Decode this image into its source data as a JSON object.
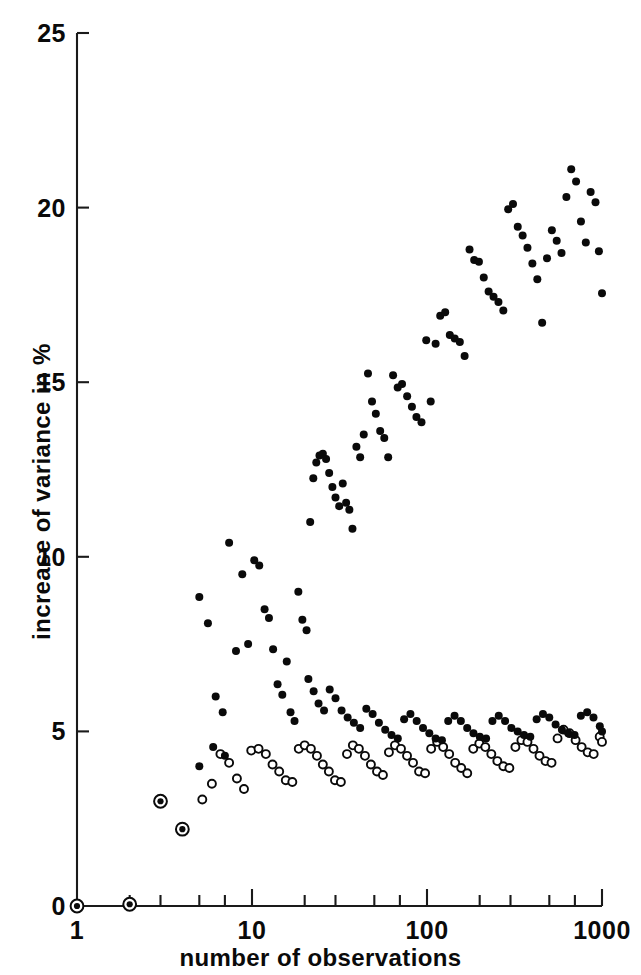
{
  "chart_data": {
    "type": "scatter",
    "title": "",
    "xlabel": "number of observations",
    "ylabel": "increase of variance in %",
    "xscale": "log",
    "xlim": [
      1,
      1000
    ],
    "ylim": [
      0,
      25
    ],
    "grid": false,
    "legend_position": "none",
    "xticks": [
      {
        "value": 1,
        "label": "1"
      },
      {
        "value": 2,
        "label": ""
      },
      {
        "value": 3,
        "label": ""
      },
      {
        "value": 5,
        "label": ""
      },
      {
        "value": 7,
        "label": ""
      },
      {
        "value": 10,
        "label": "10"
      },
      {
        "value": 20,
        "label": ""
      },
      {
        "value": 30,
        "label": ""
      },
      {
        "value": 50,
        "label": ""
      },
      {
        "value": 70,
        "label": ""
      },
      {
        "value": 100,
        "label": "100"
      },
      {
        "value": 200,
        "label": ""
      },
      {
        "value": 300,
        "label": ""
      },
      {
        "value": 500,
        "label": ""
      },
      {
        "value": 700,
        "label": ""
      },
      {
        "value": 1000,
        "label": "1000"
      }
    ],
    "xtick_major_labels": [
      "1",
      "10",
      "100",
      "1000"
    ],
    "yticks": [
      {
        "value": 0,
        "label": "0"
      },
      {
        "value": 5,
        "label": "5"
      },
      {
        "value": 10,
        "label": "10"
      },
      {
        "value": 15,
        "label": "15"
      },
      {
        "value": 20,
        "label": "20"
      },
      {
        "value": 25,
        "label": "25"
      }
    ],
    "series": [
      {
        "name": "filled-series",
        "marker": "filled-circle",
        "color": "#0a0a0a",
        "points": [
          [
            1,
            0.0
          ],
          [
            2,
            0.05
          ],
          [
            3,
            3.0
          ],
          [
            4,
            2.2
          ],
          [
            5,
            8.85
          ],
          [
            5.6,
            8.1
          ],
          [
            6.2,
            6.0
          ],
          [
            6.8,
            5.55
          ],
          [
            7.4,
            10.4
          ],
          [
            8.1,
            7.3
          ],
          [
            8.8,
            9.5
          ],
          [
            9.5,
            7.5
          ],
          [
            10.3,
            9.9
          ],
          [
            11.0,
            9.75
          ],
          [
            11.8,
            8.5
          ],
          [
            12.5,
            8.25
          ],
          [
            13.2,
            7.35
          ],
          [
            14.0,
            6.35
          ],
          [
            14.9,
            6.05
          ],
          [
            15.8,
            7.0
          ],
          [
            16.6,
            5.55
          ],
          [
            17.5,
            5.3
          ],
          [
            18.4,
            9.0
          ],
          [
            19.4,
            8.2
          ],
          [
            20.5,
            7.9
          ],
          [
            21.5,
            11.0
          ],
          [
            22.4,
            12.25
          ],
          [
            23.3,
            12.7
          ],
          [
            24.3,
            12.9
          ],
          [
            25.4,
            12.95
          ],
          [
            26.5,
            12.8
          ],
          [
            27.6,
            12.4
          ],
          [
            28.8,
            12.0
          ],
          [
            30.0,
            11.7
          ],
          [
            31.5,
            11.45
          ],
          [
            33.0,
            12.1
          ],
          [
            34.5,
            11.55
          ],
          [
            36.0,
            11.35
          ],
          [
            37.5,
            10.8
          ],
          [
            39.5,
            13.15
          ],
          [
            41.5,
            12.85
          ],
          [
            43.5,
            13.5
          ],
          [
            46.0,
            15.25
          ],
          [
            48.5,
            14.45
          ],
          [
            51.0,
            14.1
          ],
          [
            54.0,
            13.6
          ],
          [
            57.0,
            13.4
          ],
          [
            60.0,
            12.85
          ],
          [
            64.0,
            15.2
          ],
          [
            68.0,
            14.85
          ],
          [
            72.0,
            14.95
          ],
          [
            77.0,
            14.6
          ],
          [
            82.0,
            14.3
          ],
          [
            87.0,
            14.0
          ],
          [
            93.0,
            13.85
          ],
          [
            99.0,
            16.2
          ],
          [
            105.0,
            14.45
          ],
          [
            112.0,
            16.1
          ],
          [
            119.0,
            16.9
          ],
          [
            127.0,
            17.0
          ],
          [
            135.0,
            16.35
          ],
          [
            144.0,
            16.25
          ],
          [
            154.0,
            16.15
          ],
          [
            164.0,
            15.75
          ],
          [
            175.0,
            18.8
          ],
          [
            186.0,
            18.5
          ],
          [
            198.0,
            18.45
          ],
          [
            211.0,
            18.0
          ],
          [
            225.0,
            17.6
          ],
          [
            240.0,
            17.45
          ],
          [
            256.0,
            17.3
          ],
          [
            273.0,
            17.05
          ],
          [
            291.0,
            19.95
          ],
          [
            310.0,
            20.1
          ],
          [
            330.0,
            19.45
          ],
          [
            352.0,
            19.2
          ],
          [
            375.0,
            18.85
          ],
          [
            400.0,
            18.4
          ],
          [
            427.0,
            17.95
          ],
          [
            455.0,
            16.7
          ],
          [
            485.0,
            18.55
          ],
          [
            517.0,
            19.35
          ],
          [
            551.0,
            19.05
          ],
          [
            587.0,
            18.7
          ],
          [
            626.0,
            20.3
          ],
          [
            667.0,
            21.1
          ],
          [
            711.0,
            20.75
          ],
          [
            758.0,
            19.6
          ],
          [
            808.0,
            19.0
          ],
          [
            861.0,
            20.45
          ],
          [
            918.0,
            20.15
          ],
          [
            960.0,
            18.75
          ],
          [
            1000.0,
            17.55
          ]
        ]
      },
      {
        "name": "open-series",
        "marker": "open-circle",
        "color": "#0a0a0a",
        "points": [
          [
            1,
            0.0
          ],
          [
            2,
            0.05
          ],
          [
            3,
            3.0
          ],
          [
            4,
            2.2
          ],
          [
            5.2,
            3.05
          ],
          [
            5.9,
            3.5
          ],
          [
            6.6,
            4.35
          ],
          [
            7.4,
            4.1
          ],
          [
            8.2,
            3.65
          ],
          [
            9.0,
            3.35
          ],
          [
            9.9,
            4.45
          ],
          [
            10.9,
            4.5
          ],
          [
            12.0,
            4.35
          ],
          [
            13.1,
            4.05
          ],
          [
            14.3,
            3.85
          ],
          [
            15.6,
            3.6
          ],
          [
            17.0,
            3.55
          ],
          [
            18.5,
            4.5
          ],
          [
            20.0,
            4.6
          ],
          [
            21.7,
            4.5
          ],
          [
            23.5,
            4.3
          ],
          [
            25.4,
            4.05
          ],
          [
            27.5,
            3.85
          ],
          [
            29.8,
            3.6
          ],
          [
            32.2,
            3.55
          ],
          [
            34.9,
            4.35
          ],
          [
            37.7,
            4.6
          ],
          [
            40.8,
            4.5
          ],
          [
            44.2,
            4.3
          ],
          [
            47.8,
            4.05
          ],
          [
            51.8,
            3.85
          ],
          [
            56.0,
            3.75
          ],
          [
            60.6,
            4.4
          ],
          [
            65.6,
            4.6
          ],
          [
            71.0,
            4.5
          ],
          [
            76.9,
            4.3
          ],
          [
            83.2,
            4.1
          ],
          [
            90.1,
            3.85
          ],
          [
            97.5,
            3.8
          ],
          [
            105.6,
            4.5
          ],
          [
            114.3,
            4.7
          ],
          [
            123.7,
            4.55
          ],
          [
            133.9,
            4.35
          ],
          [
            144.9,
            4.1
          ],
          [
            156.9,
            3.95
          ],
          [
            169.8,
            3.8
          ],
          [
            183.8,
            4.5
          ],
          [
            199.0,
            4.65
          ],
          [
            215.4,
            4.55
          ],
          [
            233.1,
            4.35
          ],
          [
            252.3,
            4.15
          ],
          [
            273.1,
            4.0
          ],
          [
            295.6,
            3.95
          ],
          [
            320.0,
            4.55
          ],
          [
            346.4,
            4.75
          ],
          [
            375.0,
            4.7
          ],
          [
            405.9,
            4.5
          ],
          [
            439.4,
            4.3
          ],
          [
            475.6,
            4.15
          ],
          [
            514.8,
            4.1
          ],
          [
            557.2,
            4.8
          ],
          [
            603.1,
            5.05
          ],
          [
            652.8,
            4.95
          ],
          [
            706.6,
            4.75
          ],
          [
            764.9,
            4.55
          ],
          [
            827.9,
            4.4
          ],
          [
            896.2,
            4.35
          ],
          [
            970.0,
            4.85
          ],
          [
            1000.0,
            4.7
          ]
        ]
      },
      {
        "name": "filled-series-tail-overlay",
        "marker": "filled-circle",
        "color": "#0a0a0a",
        "points": [
          [
            5.0,
            4.0
          ],
          [
            6.0,
            4.55
          ],
          [
            7.0,
            4.3
          ],
          [
            21.0,
            6.5
          ],
          [
            22.5,
            6.15
          ],
          [
            24.0,
            5.8
          ],
          [
            25.8,
            5.6
          ],
          [
            27.8,
            6.2
          ],
          [
            30.0,
            5.95
          ],
          [
            32.5,
            5.6
          ],
          [
            35.2,
            5.4
          ],
          [
            38.2,
            5.25
          ],
          [
            41.5,
            5.1
          ],
          [
            45.0,
            5.65
          ],
          [
            48.9,
            5.5
          ],
          [
            53.1,
            5.25
          ],
          [
            57.7,
            5.05
          ],
          [
            62.7,
            4.9
          ],
          [
            68.1,
            4.8
          ],
          [
            74.0,
            5.35
          ],
          [
            80.4,
            5.5
          ],
          [
            87.3,
            5.3
          ],
          [
            94.9,
            5.1
          ],
          [
            103.1,
            4.95
          ],
          [
            112.0,
            4.8
          ],
          [
            121.7,
            4.75
          ],
          [
            132.2,
            5.3
          ],
          [
            143.7,
            5.45
          ],
          [
            156.1,
            5.3
          ],
          [
            169.7,
            5.1
          ],
          [
            184.3,
            4.95
          ],
          [
            200.3,
            4.85
          ],
          [
            217.6,
            4.8
          ],
          [
            236.5,
            5.3
          ],
          [
            257.0,
            5.45
          ],
          [
            279.3,
            5.3
          ],
          [
            303.5,
            5.1
          ],
          [
            329.8,
            5.0
          ],
          [
            358.4,
            4.9
          ],
          [
            389.4,
            4.85
          ],
          [
            423.2,
            5.35
          ],
          [
            459.9,
            5.5
          ],
          [
            499.7,
            5.4
          ],
          [
            543.0,
            5.2
          ],
          [
            590.1,
            5.05
          ],
          [
            641.2,
            4.95
          ],
          [
            696.8,
            4.9
          ],
          [
            757.1,
            5.45
          ],
          [
            822.7,
            5.55
          ],
          [
            894.0,
            5.4
          ],
          [
            971.5,
            5.15
          ],
          [
            1000.0,
            5.0
          ]
        ]
      },
      {
        "name": "early-overlap-markers",
        "marker": "filled-in-open-circle",
        "color": "#0a0a0a",
        "points": [
          [
            1,
            0.0
          ],
          [
            2,
            0.05
          ],
          [
            3,
            3.0
          ],
          [
            4,
            2.2
          ]
        ]
      }
    ]
  }
}
